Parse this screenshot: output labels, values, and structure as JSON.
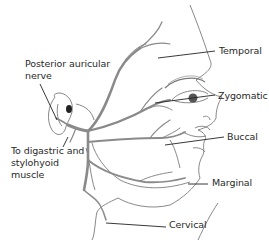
{
  "diagram": {
    "labels": {
      "posterior_auricular_line1": "Posterior auricular",
      "posterior_auricular_line2": "nerve",
      "temporal": "Temporal",
      "zygomatic": "Zygomatic",
      "buccal": "Buccal",
      "marginal": "Marginal",
      "digastric_line1": "To digastric and",
      "digastric_line2": "stylohyoid",
      "digastric_line3": "muscle",
      "cervical": "Cervical"
    },
    "colors": {
      "nerve": "#8a8a8a",
      "outline": "#777777",
      "leader": "#222222",
      "text": "#2a2a2a",
      "background": "#ffffff"
    }
  }
}
